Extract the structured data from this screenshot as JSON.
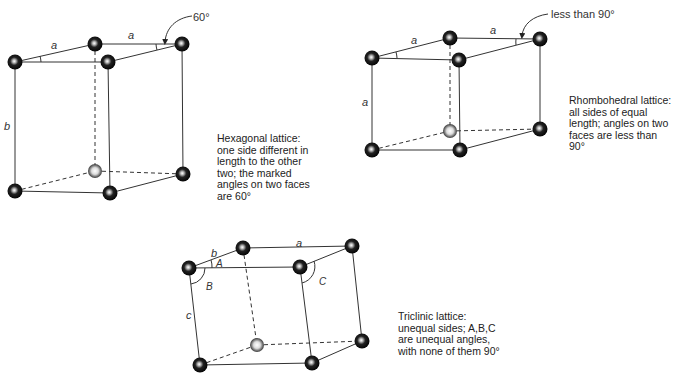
{
  "hexagonal": {
    "labels": {
      "top_left_edge": "a",
      "top_back_edge": "a",
      "vertical_edge": "b",
      "angle_callout": "60°"
    },
    "caption": [
      "Hexagonal lattice:",
      "one side different in",
      "length to the other",
      "two; the marked",
      "angles on two faces",
      "are 60°"
    ]
  },
  "rhombohedral": {
    "labels": {
      "top_left_edge": "a",
      "top_back_edge": "a",
      "vertical_edge": "a",
      "angle_callout": "less than 90°"
    },
    "caption": [
      "Rhombohedral lattice:",
      "all sides of equal",
      "length; angles on two",
      "faces are less than",
      "90°"
    ]
  },
  "triclinic": {
    "labels": {
      "left_top_edge": "b",
      "top_back_edge": "a",
      "vertical_edge": "c",
      "angle_a": "A",
      "angle_b": "B",
      "angle_c": "C"
    },
    "caption": [
      "Triclinic lattice:",
      "unequal sides; A,B,C",
      "are unequal angles,",
      "with none of them 90°"
    ]
  },
  "colors": {
    "line": "#333333",
    "atom": "#111111",
    "atom_highlight": "#dddddd"
  }
}
